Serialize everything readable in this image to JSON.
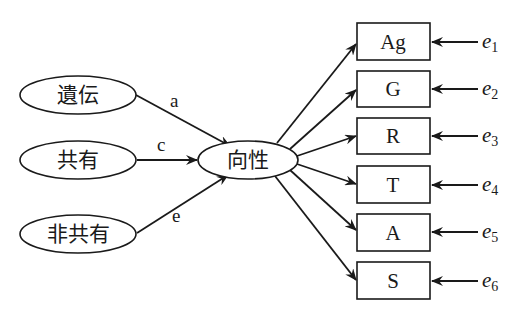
{
  "diagram": {
    "type": "path-diagram",
    "sources": [
      {
        "id": "heredity",
        "label": "遺伝",
        "path_label": "a"
      },
      {
        "id": "shared",
        "label": "共有",
        "path_label": "c"
      },
      {
        "id": "nonshared",
        "label": "非共有",
        "path_label": "e"
      }
    ],
    "latent": {
      "id": "orientation",
      "label": "向性"
    },
    "indicators": [
      {
        "id": "ag",
        "label": "Ag",
        "error": "e",
        "error_sub": "1"
      },
      {
        "id": "g",
        "label": "G",
        "error": "e",
        "error_sub": "2"
      },
      {
        "id": "r",
        "label": "R",
        "error": "e",
        "error_sub": "3"
      },
      {
        "id": "t",
        "label": "T",
        "error": "e",
        "error_sub": "4"
      },
      {
        "id": "a",
        "label": "A",
        "error": "e",
        "error_sub": "5"
      },
      {
        "id": "s",
        "label": "S",
        "error": "e",
        "error_sub": "6"
      }
    ],
    "colors": {
      "stroke": "#1a1a1a",
      "background": "#ffffff"
    }
  }
}
